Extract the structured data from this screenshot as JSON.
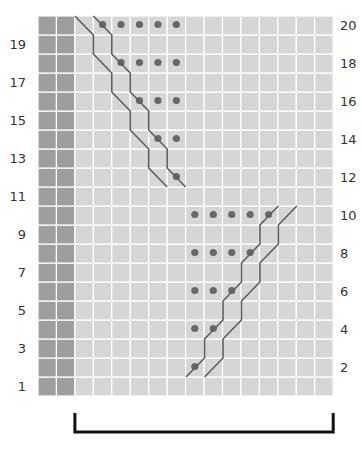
{
  "chart": {
    "columns": 16,
    "rows": 20,
    "border_columns": 2,
    "colors": {
      "border_cell": "#9e9e9e",
      "main_cell": "#d6d6d6",
      "grid_line": "#ffffff",
      "dot": "#686868",
      "cable_line": "#5e5e5e",
      "bracket": "#111111"
    },
    "left_row_labels": [
      "19",
      "17",
      "15",
      "13",
      "11",
      "9",
      "7",
      "5",
      "3",
      "1"
    ],
    "right_row_labels": [
      "20",
      "18",
      "16",
      "14",
      "12",
      "10",
      "8",
      "6",
      "4",
      "2"
    ]
  },
  "chart_data": {
    "type": "table",
    "xlabel": "",
    "ylabel": "Row",
    "grid": true,
    "row_numbers_odd_left": [
      19,
      17,
      15,
      13,
      11,
      9,
      7,
      5,
      3,
      1
    ],
    "row_numbers_even_right": [
      20,
      18,
      16,
      14,
      12,
      10,
      8,
      6,
      4,
      2
    ],
    "border_stitch_columns": [
      1,
      2
    ],
    "purl_dots": [
      {
        "row": 20,
        "columns": [
          4,
          5,
          6,
          7,
          8
        ]
      },
      {
        "row": 18,
        "columns": [
          5,
          6,
          7,
          8
        ]
      },
      {
        "row": 16,
        "columns": [
          6,
          7,
          8
        ]
      },
      {
        "row": 14,
        "columns": [
          7,
          8
        ]
      },
      {
        "row": 12,
        "columns": [
          8
        ]
      },
      {
        "row": 10,
        "columns": [
          9,
          10,
          11,
          12,
          13
        ]
      },
      {
        "row": 8,
        "columns": [
          9,
          10,
          11,
          12
        ]
      },
      {
        "row": 6,
        "columns": [
          9,
          10,
          11
        ]
      },
      {
        "row": 4,
        "columns": [
          9,
          10
        ]
      },
      {
        "row": 2,
        "columns": [
          9
        ]
      }
    ],
    "cables": [
      {
        "name": "upper-cable",
        "direction": "right-slanting-down",
        "rows": [
          12,
          20
        ],
        "start_column": 3
      },
      {
        "name": "lower-cable",
        "direction": "left-slanting-up",
        "rows": [
          1,
          10
        ],
        "start_column": 9
      }
    ],
    "repeat_bracket": {
      "from_column": 3,
      "to_column": 16
    }
  }
}
